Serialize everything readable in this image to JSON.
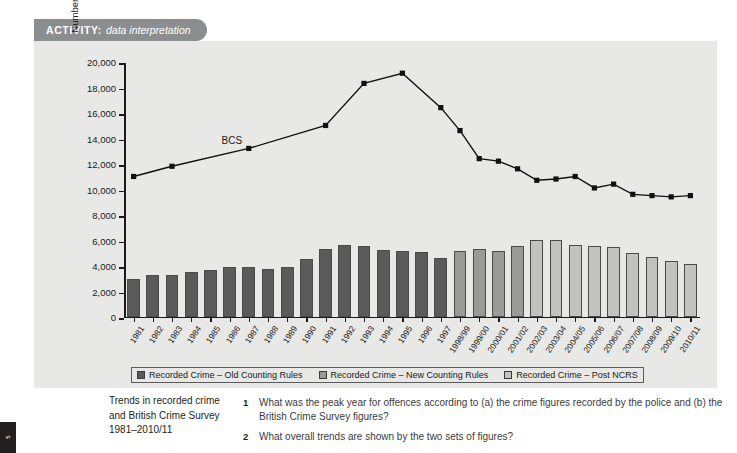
{
  "banner": {
    "label": "ACTIVITY:",
    "subtitle": "data interpretation"
  },
  "edge_tab": {
    "text": "5"
  },
  "colors": {
    "banner_bg": "#8b8d8f",
    "panel_bg": "#e8e8e6",
    "bar_old": "#5a5a5a",
    "bar_new": "#9a9a98",
    "bar_ncrs": "#c2c2bf",
    "line": "#111111",
    "axis": "#1a1a1a"
  },
  "legend": {
    "items": [
      {
        "label": "Recorded Crime – Old Counting Rules",
        "color": "#5a5a5a"
      },
      {
        "label": "Recorded Crime – New Counting Rules",
        "color": "#9a9a98"
      },
      {
        "label": "Recorded Crime – Post NCRS",
        "color": "#c2c2bf"
      }
    ]
  },
  "caption": {
    "line1": "Trends in recorded crime",
    "line2": "and British Crime Survey",
    "line3": "1981–2010/11"
  },
  "questions": [
    {
      "num": "1",
      "text": "What was the peak year for offences according to (a) the crime figures recorded by the police and (b) the British Crime Survey figures?"
    },
    {
      "num": "2",
      "text": "What overall trends are shown by the two sets of figures?"
    }
  ],
  "chart_data": {
    "type": "bar",
    "title": "Trends in recorded crime and British Crime Survey 1981–2010/11",
    "xlabel": "",
    "ylabel": "Number of offences (000s)",
    "ylim": [
      0,
      20000
    ],
    "ytick_values": [
      0,
      2000,
      4000,
      6000,
      8000,
      10000,
      12000,
      14000,
      16000,
      18000,
      20000
    ],
    "ytick_labels": [
      "0",
      "2,000",
      "4,000",
      "6,000",
      "8,000",
      "10,000",
      "12,000",
      "14,000",
      "16,000",
      "18,000",
      "20,000"
    ],
    "grid": false,
    "legend_position": "below-axis",
    "annotations": [
      {
        "text": "BCS",
        "x_category": "1986",
        "y": 13900
      }
    ],
    "categories": [
      "1981",
      "1982",
      "1983",
      "1984",
      "1985",
      "1986",
      "1987",
      "1988",
      "1989",
      "1990",
      "1991",
      "1992",
      "1993",
      "1994",
      "1995",
      "1996",
      "1997",
      "1998/99",
      "1999/00",
      "2000/01",
      "2001/02",
      "2002/03",
      "2003/04",
      "2004/05",
      "2005/06",
      "2006/07",
      "2007/08",
      "2008/09",
      "2009/10",
      "2010/11"
    ],
    "series": [
      {
        "name": "Recorded Crime – Old Counting Rules",
        "type": "bar",
        "color": "#5a5a5a",
        "values": [
          2964,
          3262,
          3247,
          3499,
          3612,
          3847,
          3892,
          3716,
          3871,
          4544,
          5276,
          5592,
          5526,
          5253,
          5100,
          5036,
          4598,
          4482,
          null,
          null,
          null,
          null,
          null,
          null,
          null,
          null,
          null,
          null,
          null,
          null
        ]
      },
      {
        "name": "Recorded Crime – New Counting Rules",
        "type": "bar",
        "color": "#9a9a98",
        "values": [
          null,
          null,
          null,
          null,
          null,
          null,
          null,
          null,
          null,
          null,
          null,
          null,
          null,
          null,
          null,
          null,
          null,
          5109,
          5301,
          5171,
          5525,
          null,
          null,
          null,
          null,
          null,
          null,
          null,
          null,
          null
        ]
      },
      {
        "name": "Recorded Crime – Post NCRS",
        "type": "bar",
        "color": "#c2c2bf",
        "values": [
          null,
          null,
          null,
          null,
          null,
          null,
          null,
          null,
          null,
          null,
          null,
          null,
          null,
          null,
          null,
          null,
          null,
          null,
          null,
          null,
          null,
          5975,
          6014,
          5637,
          5555,
          5428,
          4951,
          4703,
          4338,
          4151
        ]
      },
      {
        "name": "BCS",
        "type": "line",
        "color": "#111111",
        "marker": "square",
        "values": [
          11100,
          null,
          11900,
          null,
          null,
          null,
          13300,
          null,
          null,
          null,
          15100,
          null,
          18400,
          null,
          19200,
          null,
          16500,
          14700,
          12500,
          12300,
          11700,
          10800,
          10900,
          11100,
          10200,
          10500,
          9700,
          9600,
          9500,
          9600
        ]
      }
    ]
  }
}
